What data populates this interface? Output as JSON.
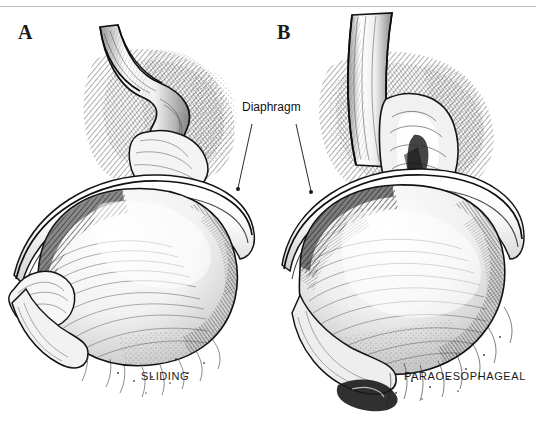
{
  "figure": {
    "background_color": "#ffffff",
    "ink_color": "#111111",
    "rule_color": "#b9b9b9"
  },
  "panels": [
    {
      "letter": "A",
      "caption": "SLIDING",
      "description": "Sliding hiatal hernia: gastro-oesophageal junction and cardia displaced upward through the oesophageal hiatus of the diaphragm",
      "structures": [
        "oesophagus",
        "diaphragm",
        "stomach",
        "gastro-oesophageal junction"
      ]
    },
    {
      "letter": "B",
      "caption": "PARAOESOPHAGEAL",
      "description": "Paraoesophageal hiatal hernia: gastric fundus herniates alongside the oesophagus while the junction remains below the diaphragm",
      "structures": [
        "oesophagus",
        "diaphragm",
        "stomach",
        "herniated fundus"
      ]
    }
  ],
  "annotations": [
    {
      "label": "Diaphragm",
      "leader_lines": 2,
      "targets": [
        "panel-a-diaphragm",
        "panel-b-diaphragm"
      ]
    }
  ],
  "captions": {
    "left": "SLIDING",
    "right": "PARAOESOPHAGEAL"
  }
}
